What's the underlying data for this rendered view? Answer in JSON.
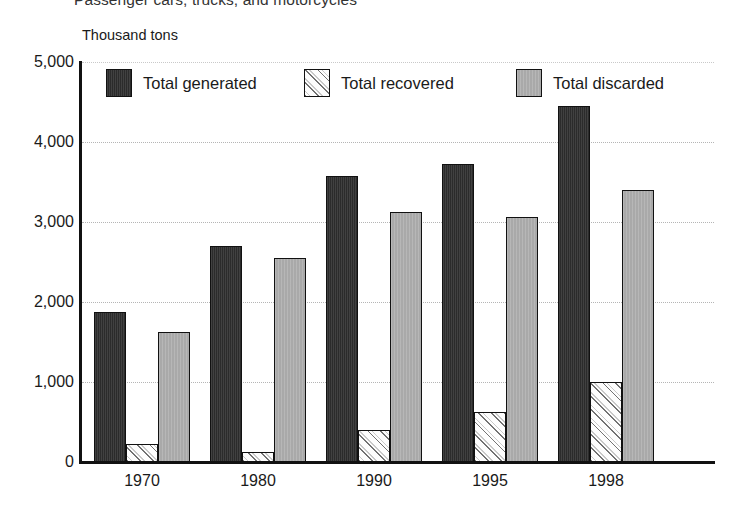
{
  "figure": {
    "title": "Passenger cars, trucks, and motorcycles",
    "axis_unit_label": "Thousand tons"
  },
  "legend": {
    "items": [
      {
        "label": "Total generated",
        "swatch": "dark-solid-swatch",
        "color": "#2b2b2b"
      },
      {
        "label": "Total recovered",
        "swatch": "white-hatched-swatch",
        "color": "#ffffff"
      },
      {
        "label": "Total discarded",
        "swatch": "gray-solid-swatch",
        "color": "#a9a9a9"
      }
    ]
  },
  "chart_data": {
    "type": "bar",
    "title": "Passenger cars, trucks, and motorcycles",
    "xlabel": "",
    "ylabel": "Thousand tons",
    "ylim": [
      0,
      5000
    ],
    "yticks": [
      0,
      1000,
      2000,
      3000,
      4000,
      5000
    ],
    "ytick_labels": [
      "0",
      "1,000",
      "2,000",
      "3,000",
      "4,000",
      "5,000"
    ],
    "grid": true,
    "grid_axis": "y",
    "legend_position": "upper-left-inside",
    "categories": [
      "1970",
      "1980",
      "1990",
      "1995",
      "1998"
    ],
    "series": [
      {
        "name": "Total generated",
        "color": "#2b2b2b",
        "values": [
          1880,
          2700,
          3580,
          3730,
          4450
        ]
      },
      {
        "name": "Total recovered",
        "color": "#ffffff",
        "values": [
          230,
          130,
          400,
          630,
          1000
        ]
      },
      {
        "name": "Total discarded",
        "color": "#a9a9a9",
        "values": [
          1620,
          2550,
          3130,
          3060,
          3400
        ]
      }
    ]
  }
}
